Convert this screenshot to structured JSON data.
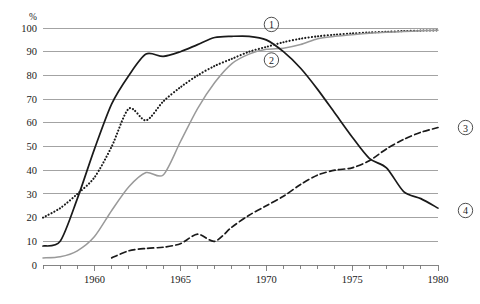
{
  "chart_data": {
    "type": "line",
    "title": "",
    "subtitle": "",
    "xlabel": "",
    "ylabel": "%",
    "unit_label": "%",
    "xlim": [
      1957,
      1980
    ],
    "ylim": [
      0,
      100
    ],
    "grid": true,
    "grid_axis": "y",
    "legend_position": "inline-end-labels",
    "y_ticks": [
      0,
      10,
      20,
      30,
      40,
      50,
      60,
      70,
      80,
      90,
      100
    ],
    "y_tick_labels": [
      "0",
      "10",
      "20",
      "30",
      "40",
      "50",
      "60",
      "70",
      "80",
      "90",
      "100"
    ],
    "x_ticks": [
      1957,
      1958,
      1959,
      1960,
      1961,
      1962,
      1963,
      1964,
      1965,
      1966,
      1967,
      1968,
      1969,
      1970,
      1971,
      1972,
      1973,
      1974,
      1975,
      1976,
      1977,
      1978,
      1979,
      1980
    ],
    "x_labeled_ticks": [
      1960,
      1965,
      1970,
      1975,
      1980
    ],
    "x_tick_labels": [
      "1960",
      "1965",
      "1970",
      "1975",
      "1980"
    ],
    "series": [
      {
        "name": "1",
        "label": "①",
        "style": "dotted",
        "color": "#1a1a1a",
        "width": 2.1,
        "dasharray": "0.1 3.1",
        "linecap": "round",
        "label_x": 1970.3,
        "label_y": 101.5,
        "x": [
          1957,
          1958,
          1959,
          1960,
          1961,
          1962,
          1963,
          1964,
          1965,
          1966,
          1967,
          1968,
          1969,
          1970,
          1971,
          1972,
          1973,
          1974,
          1975,
          1976,
          1977,
          1978,
          1979,
          1980
        ],
        "values": [
          20,
          24,
          30,
          37,
          50,
          66,
          61,
          69,
          75,
          80,
          84,
          87,
          90,
          92,
          94,
          95.5,
          96.5,
          97.2,
          97.7,
          98.1,
          98.4,
          98.7,
          98.9,
          99
        ]
      },
      {
        "name": "2",
        "label": "②",
        "style": "solid",
        "color": "#9a9a9a",
        "width": 1.5,
        "dasharray": "",
        "linecap": "round",
        "label_x": 1970.3,
        "label_y": 86.5,
        "x": [
          1957,
          1958,
          1959,
          1960,
          1961,
          1962,
          1963,
          1964,
          1965,
          1966,
          1967,
          1968,
          1969,
          1970,
          1971,
          1972,
          1973,
          1974,
          1975,
          1976,
          1977,
          1978,
          1979,
          1980
        ],
        "values": [
          3,
          3.5,
          6,
          12,
          23,
          33,
          39,
          38,
          52,
          66,
          77,
          85,
          89,
          91,
          91.5,
          93,
          95.5,
          96.5,
          97.2,
          97.8,
          98.2,
          98.5,
          98.8,
          99
        ]
      },
      {
        "name": "3",
        "label": "③",
        "style": "dashed",
        "color": "#1a1a1a",
        "width": 1.7,
        "dasharray": "6 3.4",
        "linecap": "butt",
        "label_x": 1981.6,
        "label_y": 58,
        "x": [
          1961,
          1962,
          1963,
          1964,
          1965,
          1966,
          1967,
          1968,
          1969,
          1970,
          1971,
          1972,
          1973,
          1974,
          1975,
          1976,
          1977,
          1978,
          1979,
          1980
        ],
        "values": [
          3,
          6,
          7,
          7.5,
          9,
          13,
          10,
          16,
          21,
          25,
          29,
          34,
          38,
          40,
          41,
          44,
          49,
          53,
          56,
          58
        ]
      },
      {
        "name": "4",
        "label": "④",
        "style": "solid",
        "color": "#1a1a1a",
        "width": 1.7,
        "dasharray": "",
        "linecap": "round",
        "label_x": 1981.6,
        "label_y": 23,
        "x": [
          1957,
          1958,
          1959,
          1960,
          1961,
          1962,
          1963,
          1964,
          1965,
          1966,
          1967,
          1968,
          1969,
          1970,
          1971,
          1972,
          1973,
          1974,
          1975,
          1976,
          1977,
          1978,
          1979,
          1980
        ],
        "values": [
          8,
          10,
          28,
          49,
          68,
          80,
          89,
          88,
          90,
          93,
          96,
          96.5,
          96.5,
          95,
          90,
          83,
          74,
          64,
          54,
          45,
          41,
          31,
          28,
          24
        ]
      }
    ]
  }
}
